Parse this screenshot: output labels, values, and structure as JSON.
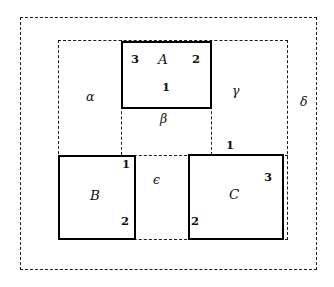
{
  "figure": {
    "colors": {
      "solid_stroke": "#000000",
      "dashed_stroke": "#1a1a1a",
      "background": "#ffffff",
      "text": "#111111"
    },
    "solid_boxes": [
      {
        "id": "box-a",
        "label": "A",
        "corner_numbers": {
          "top_left": "3",
          "top_right": "2",
          "bottom_center": "1"
        }
      },
      {
        "id": "box-b",
        "label": "B",
        "corner_numbers": {
          "top_right": "1",
          "bottom_right": "2"
        }
      },
      {
        "id": "box-c",
        "label": "C",
        "corner_numbers": {
          "top_outside": "1",
          "right": "3",
          "bottom_left": "2"
        }
      }
    ],
    "region_labels": [
      {
        "id": "region-alpha",
        "text": "α"
      },
      {
        "id": "region-beta",
        "text": "β"
      },
      {
        "id": "region-gamma",
        "text": "γ"
      },
      {
        "id": "region-delta",
        "text": "δ"
      },
      {
        "id": "region-epsilon",
        "text": "ϵ"
      }
    ],
    "box_a": {
      "name": "A",
      "n_top_left": "3",
      "n_top_right": "2",
      "n_bottom": "1"
    },
    "box_b": {
      "name": "B",
      "n_top_right": "1",
      "n_bottom_right": "2"
    },
    "box_c": {
      "name": "C",
      "n_top": "1",
      "n_right": "3",
      "n_bottom_left": "2"
    },
    "greek": {
      "alpha": "α",
      "beta": "β",
      "gamma": "γ",
      "delta": "δ",
      "epsilon": "ϵ"
    }
  }
}
